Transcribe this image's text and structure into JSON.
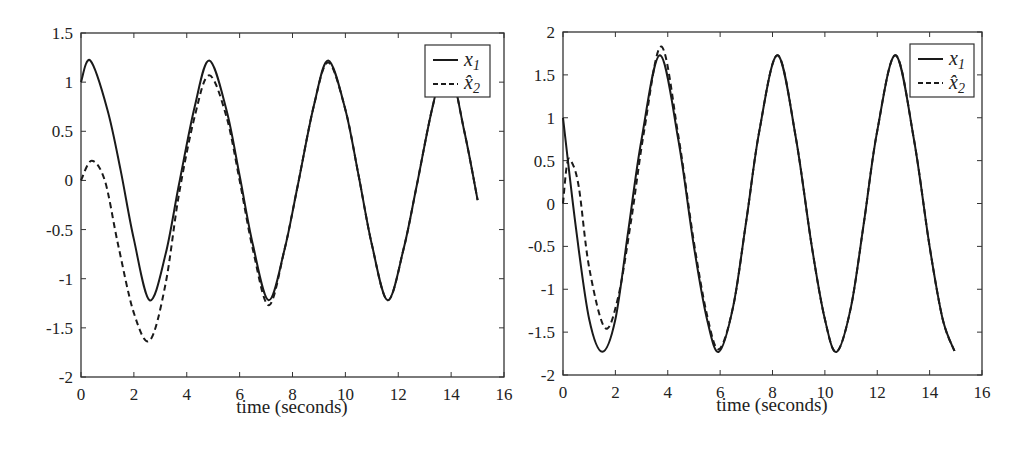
{
  "chart_data": [
    {
      "type": "line",
      "title": "",
      "xlabel": "time (seconds)",
      "ylabel": "",
      "xlim": [
        0,
        16
      ],
      "ylim": [
        -2,
        1.5
      ],
      "xticks": [
        "0",
        "2",
        "4",
        "6",
        "8",
        "10",
        "12",
        "14",
        "16"
      ],
      "yticks": [
        "1.5",
        "1",
        "0.5",
        "0",
        "-0.5",
        "-1",
        "-1.5",
        "-2"
      ],
      "grid": false,
      "legend_position": "upper right",
      "series": [
        {
          "name": "x1",
          "style": "solid",
          "x": [
            0,
            0.35,
            1.0,
            1.5,
            2.0,
            2.6,
            3.2,
            3.7,
            4.3,
            4.85,
            5.5,
            6.0,
            6.5,
            7.1,
            7.7,
            8.2,
            8.8,
            9.35,
            10.0,
            10.5,
            11.0,
            11.6,
            12.2,
            12.7,
            13.3,
            13.85,
            14.5,
            15.0
          ],
          "y": [
            1.0,
            1.22,
            0.72,
            0.1,
            -0.6,
            -1.22,
            -0.75,
            -0.05,
            0.75,
            1.22,
            0.72,
            0.05,
            -0.65,
            -1.22,
            -0.7,
            -0.05,
            0.75,
            1.22,
            0.72,
            0.05,
            -0.65,
            -1.22,
            -0.7,
            -0.05,
            0.75,
            1.22,
            0.5,
            -0.2
          ]
        },
        {
          "name": "x̂2",
          "style": "dashed",
          "x": [
            0,
            0.4,
            0.9,
            1.4,
            2.0,
            2.6,
            3.2,
            3.7,
            4.3,
            4.85,
            5.5,
            6.0,
            6.5,
            7.1,
            7.7,
            8.2,
            8.8,
            9.35,
            10.0,
            10.5,
            11.0,
            11.6,
            12.2,
            12.7,
            13.3,
            13.85,
            14.5,
            15.0
          ],
          "y": [
            0.0,
            0.2,
            0.0,
            -0.65,
            -1.35,
            -1.63,
            -1.05,
            -0.15,
            0.65,
            1.07,
            0.65,
            0.0,
            -0.7,
            -1.27,
            -0.7,
            -0.05,
            0.75,
            1.2,
            0.72,
            0.05,
            -0.65,
            -1.22,
            -0.7,
            -0.05,
            0.75,
            1.22,
            0.5,
            -0.2
          ]
        }
      ]
    },
    {
      "type": "line",
      "title": "",
      "xlabel": "time (seconds)",
      "ylabel": "",
      "xlim": [
        0,
        16
      ],
      "ylim": [
        -2,
        2
      ],
      "xticks": [
        "0",
        "2",
        "4",
        "6",
        "8",
        "10",
        "12",
        "14",
        "16"
      ],
      "yticks": [
        "2",
        "1.5",
        "1",
        "0.5",
        "0",
        "-0.5",
        "-1",
        "-1.5",
        "-2"
      ],
      "grid": false,
      "legend_position": "upper right",
      "series": [
        {
          "name": "x1",
          "style": "solid",
          "x": [
            0,
            0.5,
            1.0,
            1.5,
            2.0,
            2.5,
            3.0,
            3.7,
            4.4,
            5.0,
            5.5,
            5.95,
            6.5,
            7.0,
            7.5,
            8.2,
            8.9,
            9.5,
            10.0,
            10.45,
            11.0,
            11.5,
            12.0,
            12.7,
            13.4,
            14.0,
            14.5,
            14.95
          ],
          "y": [
            1.0,
            -0.3,
            -1.35,
            -1.73,
            -1.35,
            -0.3,
            0.75,
            1.73,
            0.75,
            -0.5,
            -1.35,
            -1.73,
            -1.2,
            -0.2,
            0.85,
            1.73,
            0.75,
            -0.5,
            -1.35,
            -1.73,
            -1.2,
            -0.2,
            0.85,
            1.73,
            0.75,
            -0.5,
            -1.35,
            -1.72
          ]
        },
        {
          "name": "x̂2",
          "style": "dashed",
          "x": [
            0,
            0.15,
            0.3,
            0.6,
            1.0,
            1.6,
            2.1,
            2.6,
            3.1,
            3.75,
            4.4,
            5.0,
            5.5,
            5.95,
            6.5,
            7.0,
            7.5,
            8.2,
            8.9,
            9.5,
            10.0,
            10.45,
            11.0,
            11.5,
            12.0,
            12.7,
            13.4,
            14.0,
            14.5,
            14.95
          ],
          "y": [
            0.0,
            0.45,
            0.5,
            0.2,
            -0.75,
            -1.45,
            -1.1,
            -0.2,
            0.85,
            1.83,
            0.8,
            -0.45,
            -1.3,
            -1.7,
            -1.2,
            -0.2,
            0.85,
            1.73,
            0.75,
            -0.5,
            -1.35,
            -1.73,
            -1.2,
            -0.2,
            0.85,
            1.73,
            0.75,
            -0.5,
            -1.35,
            -1.72
          ]
        }
      ]
    }
  ],
  "plots": {
    "left": {
      "xlabel": "time (seconds)",
      "legend": {
        "entry1": "x",
        "entry1_sub": "1",
        "entry2": "x̂",
        "entry2_sub": "2"
      }
    },
    "right": {
      "xlabel": "time (seconds)",
      "legend": {
        "entry1": "x",
        "entry1_sub": "1",
        "entry2": "x̂",
        "entry2_sub": "2"
      }
    }
  },
  "colors": {
    "line": "#1a1a1a",
    "axis": "#333333",
    "background": "#ffffff"
  }
}
